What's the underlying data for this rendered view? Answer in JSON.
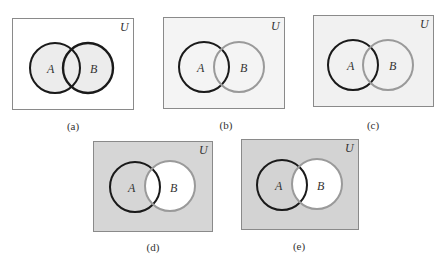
{
  "figure": {
    "universe_label": "U",
    "set_a_label": "A",
    "set_b_label": "B",
    "colors": {
      "page_bg": "#ffffff",
      "box_border": "#8a8a8a",
      "circle_a_stroke": "#1a1a1a",
      "circle_b_stroke_dark": "#1a1a1a",
      "circle_b_stroke_gray": "#9a9a9a",
      "light_fill": "#eeeeee",
      "lighter_bg": "#f3f3f3",
      "medium_bg": "#d4d4d4",
      "white": "#ffffff"
    },
    "panels": [
      {
        "id": "a",
        "caption": "(a)",
        "shaded_region": "A ∪ B",
        "box_bg": "#ffffff",
        "a_fill": "#ececec",
        "b_fill": "#ececec",
        "b_stroke": "#1a1a1a"
      },
      {
        "id": "b",
        "caption": "(b)",
        "shaded_region": "universe (light)",
        "box_bg": "#f4f4f4",
        "a_fill": "none",
        "b_fill": "none",
        "b_stroke": "#9a9a9a"
      },
      {
        "id": "c",
        "caption": "(c)",
        "shaded_region": "universe (light)",
        "box_bg": "#f1f1f1",
        "a_fill": "none",
        "b_fill": "none",
        "b_stroke": "#9a9a9a"
      },
      {
        "id": "d",
        "caption": "(d)",
        "shaded_region": "complement of B",
        "box_bg": "#d6d6d6",
        "a_fill": "none",
        "b_fill": "#ffffff",
        "b_stroke": "#9a9a9a"
      },
      {
        "id": "e",
        "caption": "(e)",
        "shaded_region": "complement of B",
        "box_bg": "#d3d3d3",
        "a_fill": "none",
        "b_fill": "#ffffff",
        "b_stroke": "#9a9a9a"
      }
    ]
  }
}
